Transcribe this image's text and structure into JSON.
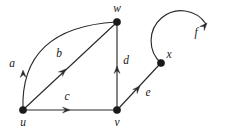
{
  "figure": {
    "kind": "directed-graph",
    "background_color": "#ffffff",
    "stroke_color": "#2b2b2b",
    "vertex_color": "#1a1a1a",
    "label_color": "#1a1a1a"
  },
  "vertices": [
    {
      "id": "u",
      "label": "u",
      "cx": 23,
      "cy": 110,
      "r": 3.6,
      "label_x": 23,
      "label_y": 123
    },
    {
      "id": "v",
      "label": "v",
      "cx": 117,
      "cy": 110,
      "r": 3.6,
      "label_x": 117,
      "label_y": 123
    },
    {
      "id": "w",
      "label": "w",
      "cx": 117,
      "cy": 22,
      "r": 3.6,
      "label_x": 117,
      "label_y": 9
    },
    {
      "id": "x",
      "label": "x",
      "cx": 161,
      "cy": 63,
      "r": 3.6,
      "label_x": 169,
      "label_y": 55
    }
  ],
  "edges": [
    {
      "id": "a",
      "label": "a",
      "from": "u",
      "to": "w",
      "shape": "curved",
      "path": "M 23 110 C 21 58 48 26 116 22",
      "arrow_x": 23,
      "arrow_y": 70,
      "arrow_angle": -92,
      "label_x": 12,
      "label_y": 64
    },
    {
      "id": "b",
      "label": "b",
      "from": "u",
      "to": "w",
      "shape": "straight",
      "path": "M 25 108 L 115 24",
      "arrow_x": 66,
      "arrow_y": 69,
      "arrow_angle": -43,
      "label_x": 59,
      "label_y": 54
    },
    {
      "id": "c",
      "label": "c",
      "from": "u",
      "to": "v",
      "shape": "straight",
      "path": "M 23 110 L 114 110",
      "arrow_x": 70,
      "arrow_y": 110,
      "arrow_angle": 0,
      "label_x": 67,
      "label_y": 97
    },
    {
      "id": "d",
      "label": "d",
      "from": "v",
      "to": "w",
      "shape": "straight",
      "path": "M 117 108 L 117 25",
      "arrow_x": 117,
      "arrow_y": 66,
      "arrow_angle": -90,
      "label_x": 126,
      "label_y": 61
    },
    {
      "id": "e",
      "label": "e",
      "from": "v",
      "to": "x",
      "shape": "straight",
      "path": "M 119 108 L 159 65",
      "arrow_x": 140,
      "arrow_y": 86,
      "arrow_angle": -47,
      "label_x": 148,
      "label_y": 93
    },
    {
      "id": "f",
      "label": "f",
      "from": "x",
      "to": "x",
      "shape": "self-loop",
      "path": "M 161 63 A 30 30 0 1 1 206 24",
      "arrow_x": 207,
      "arrow_y": 23,
      "arrow_angle": -48,
      "label_x": 196,
      "label_y": 33
    }
  ],
  "arrow": {
    "size": 7.5,
    "half_width": 3.0
  }
}
